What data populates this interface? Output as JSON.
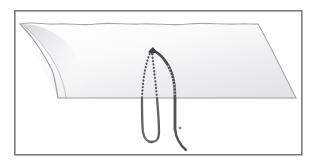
{
  "figure": {
    "width": 313,
    "height": 164,
    "background_color": "#ffffff"
  },
  "border": {
    "name": "figure-frame",
    "color": "#7a7d80",
    "width_px": 1.6,
    "inset": {
      "left": 14,
      "top": 10,
      "right": 302,
      "bottom": 155
    }
  },
  "colors": {
    "frame": "#7a7d80",
    "tissue_outline": "#a7aaad",
    "tissue_fill_light": "#ffffff",
    "tissue_fill_mid": "#f2f3f4",
    "tissue_fill_shadow": "#dcdee0",
    "suture_dark": "#4a4c50",
    "suture_mid": "#6e7175",
    "suture_light": "#8d9094",
    "needle": "#6b6e72",
    "horizon_line": "#9a9da0"
  },
  "elements": {
    "tissue_flap": {
      "name": "tissue-flap",
      "label": "Tissue sheet (flap) in perspective",
      "vertices": {
        "left": [
          20,
          24
        ],
        "top_right": [
          258,
          24
        ],
        "right": [
          296,
          98
        ],
        "bottom_left": [
          58,
          98
        ]
      },
      "far_edge_style": "wavy",
      "near_edge_style": "straight"
    },
    "near_edge_line": {
      "name": "tissue-near-edge",
      "label": "Near (cut) edge of tissue",
      "y": 98,
      "x_start": 58,
      "x_end": 296
    },
    "suture_arc_solid": {
      "name": "suture-strand-solid",
      "label": "Solid banded suture strand (front limb)",
      "style": "banded",
      "apex": [
        153,
        50
      ],
      "exit": [
        175,
        98
      ],
      "below_tissue_end": [
        175,
        127
      ]
    },
    "suture_dotted_strands": [
      {
        "name": "suture-strand-dotted-outer",
        "label": "Dotted suture strand (outer / left limb, hidden behind tissue)",
        "style": "dotted",
        "apex": [
          152,
          50
        ],
        "exit": [
          142,
          98
        ]
      },
      {
        "name": "suture-strand-dotted-inner",
        "label": "Dotted suture strand (inner / middle limb, hidden behind tissue)",
        "style": "dotted",
        "apex": [
          152,
          50
        ],
        "exit": [
          157,
          98
        ]
      }
    ],
    "suture_loop_below": {
      "name": "suture-loop-below-tissue",
      "label": "U-shaped suture loop below tissue passing under the rod",
      "left_x": 142,
      "right_x": 157,
      "bottom_y": 142
    },
    "suture_free_end": {
      "name": "suture-free-end",
      "label": "Free end of suture curving to the lower right",
      "start": [
        175,
        127
      ],
      "end": [
        185,
        150
      ]
    },
    "needle_rod": {
      "name": "needle-rod",
      "label": "Straight needle / rod passing horizontally under the tissue",
      "x_start": 82,
      "x_end": 181,
      "y": 128,
      "thickness_px": 2.4
    },
    "knot_point": {
      "name": "suture-apex-knot",
      "label": "Dark apex / knot point of suture",
      "position": [
        152,
        49
      ]
    }
  },
  "annotations": {
    "visible_text": []
  }
}
